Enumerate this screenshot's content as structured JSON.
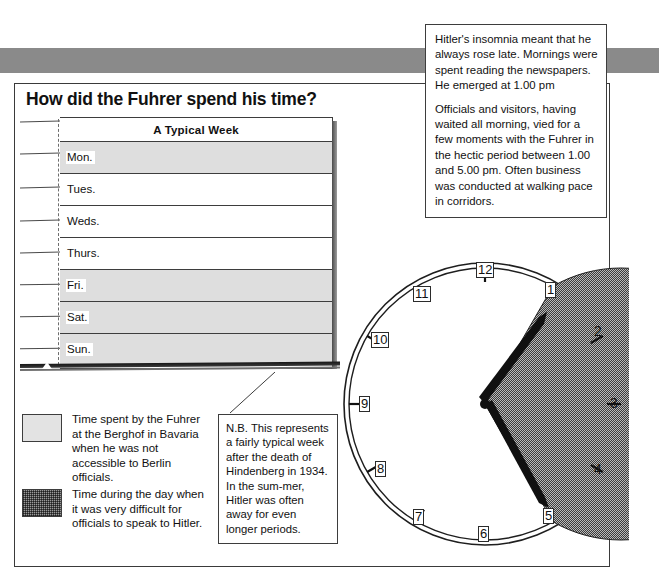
{
  "page": {
    "title": "How did the Fuhrer spend his time?"
  },
  "book": {
    "header": "A Typical Week",
    "rows": [
      {
        "day": "Mon.",
        "shaded": true
      },
      {
        "day": "Tues.",
        "shaded": false
      },
      {
        "day": "Weds.",
        "shaded": false
      },
      {
        "day": "Thurs.",
        "shaded": false
      },
      {
        "day": "Fri.",
        "shaded": true
      },
      {
        "day": "Sat.",
        "shaded": true
      },
      {
        "day": "Sun.",
        "shaded": true
      }
    ]
  },
  "legend": {
    "entries": [
      {
        "swatch": "light-grey-solid",
        "text": "Time spent by the Fuhrer at the Berghof in Bavaria when he was not accessible to Berlin officials."
      },
      {
        "swatch": "dark-grey-hatched",
        "text": "Time during the day when it was very difficult for officials to speak to Hitler."
      }
    ]
  },
  "nb_callout": {
    "text": "N.B. This represents a fairly typical week after the death of Hindenberg in 1934. In the sum-mer, Hitler was often away for even longer periods."
  },
  "insomnia_callout": {
    "paragraph1": "Hitler's insomnia meant that he always rose late. Mornings were spent reading the newspapers. He emerged at 1.00 pm",
    "paragraph2": "Officials and visitors, having waited all morning, vied for a few moments with the Fuhrer in the hectic period between 1.00 and 5.00 pm. Often business was conducted at walking pace in corridors."
  },
  "clock": {
    "numbers": [
      "12",
      "1",
      "2",
      "3",
      "4",
      "5",
      "6",
      "7",
      "8",
      "9",
      "10",
      "11"
    ],
    "boxed_numbers": [
      "12",
      "1",
      "5",
      "6",
      "7",
      "8",
      "9",
      "10",
      "11"
    ],
    "plain_numbers": [
      "2",
      "3",
      "4"
    ],
    "hand_hours": [
      1,
      5
    ],
    "shaded_from_hour": 5,
    "shaded_to_hour": 1,
    "accessible_window": "1.00 pm to 5.00 pm"
  },
  "chart_data": {
    "type": "pie",
    "categories": [
      "Difficult to speak to Hitler (5.00 pm – 1.00 pm)",
      "Hectic accessible period (1.00 pm – 5.00 pm)"
    ],
    "values": [
      8,
      4
    ],
    "unit": "hours on a 12-hour clock face",
    "colors": [
      "#9a9a9a",
      "#ffffff"
    ],
    "legend": "bottom-left",
    "annotations": [
      "hand at 1",
      "hand at 5"
    ]
  }
}
